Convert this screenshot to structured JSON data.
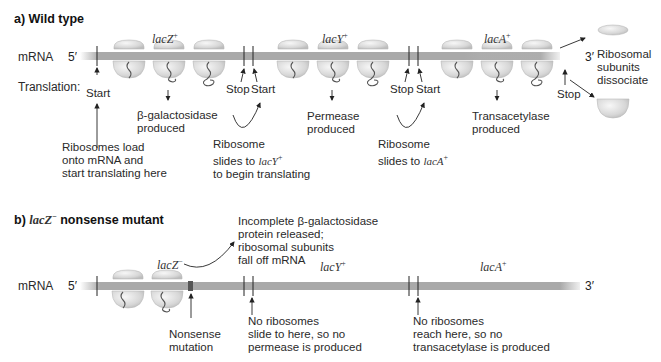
{
  "panel_a": {
    "title": "a) Wild type",
    "mrna_label": "mRNA",
    "five_prime": "5′",
    "three_prime": "3′",
    "translation_label": "Translation:",
    "genes": [
      {
        "name": "lacZ",
        "sup": "+"
      },
      {
        "name": "lacY",
        "sup": "+"
      },
      {
        "name": "lacA",
        "sup": "+"
      }
    ],
    "markers": {
      "start1": "Start",
      "stop1": "Stop",
      "start2": "Start",
      "stop2": "Stop",
      "start3": "Start",
      "stop3": "Stop"
    },
    "products": {
      "bgal": [
        "β-galactosidase",
        "produced"
      ],
      "permease": [
        "Permease",
        "produced"
      ],
      "transacetylase": [
        "Transacetylase",
        "produced"
      ]
    },
    "notes": {
      "load": [
        "Ribosomes load",
        "onto mRNA and",
        "start translating here"
      ],
      "slide_y_1": "Ribosome",
      "slide_y_2": "slides to ",
      "slide_y_gene": "lacY",
      "slide_y_sup": "+",
      "slide_y_3": "to begin translating",
      "slide_a_1": "Ribosome",
      "slide_a_2": "slides to ",
      "slide_a_gene": "lacA",
      "slide_a_sup": "+",
      "dissociate": [
        "Ribosomal",
        "subunits",
        "dissociate"
      ]
    }
  },
  "panel_b": {
    "title_prefix": "b) ",
    "title_gene": "lacZ",
    "title_sup": "−",
    "title_suffix": " nonsense mutant",
    "mrna_label": "mRNA",
    "five_prime": "5′",
    "three_prime": "3′",
    "genes": [
      {
        "name": "lacZ",
        "sup": "−"
      },
      {
        "name": "lacY",
        "sup": "+"
      },
      {
        "name": "lacA",
        "sup": "+"
      }
    ],
    "notes": {
      "released": [
        "Incomplete  β-galactosidase",
        "protein released;",
        "ribosomal subunits",
        "fall off mRNA"
      ],
      "nonsense": [
        "Nonsense",
        "mutation"
      ],
      "no_permease": [
        "No ribosomes",
        "slide to here, so no",
        "permease is produced"
      ],
      "no_transacetylase": [
        "No ribosomes",
        "reach here, so no",
        "transacetylase is produced"
      ]
    }
  }
}
